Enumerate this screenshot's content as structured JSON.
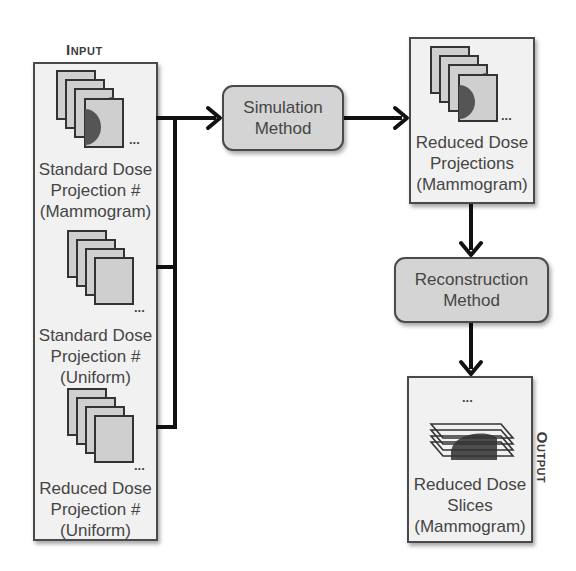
{
  "diagram": {
    "input_title": "Input",
    "output_title": "Output",
    "input_items": [
      {
        "line1": "Standard Dose",
        "line2": "Projection #",
        "line3": "(Mammogram)",
        "icon": "mammogram-stack-icon",
        "ellipsis": "..."
      },
      {
        "line1": "Standard Dose",
        "line2": "Projection #",
        "line3": "(Uniform)",
        "icon": "uniform-stack-icon",
        "ellipsis": "..."
      },
      {
        "line1": "Reduced Dose",
        "line2": "Projection #",
        "line3": "(Uniform)",
        "icon": "uniform-stack-icon",
        "ellipsis": "..."
      }
    ],
    "simulation": {
      "line1": "Simulation",
      "line2": "Method"
    },
    "reduced_projections": {
      "line1": "Reduced Dose",
      "line2": "Projections",
      "line3": "(Mammogram)",
      "ellipsis": "..."
    },
    "reconstruction": {
      "line1": "Reconstruction",
      "line2": "Method"
    },
    "output_item": {
      "line1": "Reduced Dose",
      "line2": "Slices",
      "line3": "(Mammogram)",
      "ellipsis": "..."
    },
    "colors": {
      "box_fill": "#f1f1f1",
      "process_fill": "#d4d4d4",
      "sheet_fill": "#cfcfcf",
      "stroke": "#111111",
      "blob": "#4a4a4a"
    }
  }
}
